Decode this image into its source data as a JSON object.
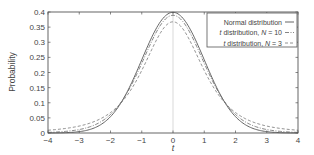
{
  "chart_data": {
    "type": "line",
    "title": "",
    "xlabel": "t",
    "ylabel": "Probability",
    "xlim": [
      -4,
      4
    ],
    "ylim": [
      0,
      0.4
    ],
    "xticks": [
      -4,
      -3,
      -2,
      -1,
      0,
      1,
      2,
      3,
      4
    ],
    "xtick_labels": [
      "−4",
      "−3",
      "−2",
      "−1",
      "0",
      "1",
      "2",
      "3",
      "4"
    ],
    "yticks": [
      0,
      0.05,
      0.1,
      0.15,
      0.2,
      0.25,
      0.3,
      0.35,
      0.4
    ],
    "ytick_labels": [
      "0",
      "0.05",
      "0.1",
      "0.15",
      "0.2",
      "0.25",
      "0.3",
      "0.35",
      "0.4"
    ],
    "grid": false,
    "vertical_reference_line_x": 0,
    "legend_position": "upper right",
    "legend": [
      {
        "label": "Normal distribution",
        "style": "solid"
      },
      {
        "label_prefix": "t distribution, ",
        "label_var": "N",
        "label_suffix": " = 10",
        "style": "dash-dot"
      },
      {
        "label_prefix": "t distribution, ",
        "label_var": "N",
        "label_suffix": " = 3",
        "style": "dashed"
      }
    ],
    "series": [
      {
        "name": "Normal distribution",
        "x": [
          -4,
          -3,
          -2,
          -1,
          0,
          1,
          2,
          3,
          4
        ],
        "values": [
          0.0001,
          0.0044,
          0.054,
          0.242,
          0.399,
          0.242,
          0.054,
          0.0044,
          0.0001
        ]
      },
      {
        "name": "t distribution, N = 10",
        "x": [
          -4,
          -3,
          -2,
          -1,
          0,
          1,
          2,
          3,
          4
        ],
        "values": [
          0.002,
          0.0114,
          0.0611,
          0.2304,
          0.3891,
          0.2304,
          0.0611,
          0.0114,
          0.002
        ]
      },
      {
        "name": "t distribution, N = 3",
        "x": [
          -4,
          -3,
          -2,
          -1,
          0,
          1,
          2,
          3,
          4
        ],
        "values": [
          0.0042,
          0.023,
          0.0675,
          0.2067,
          0.3676,
          0.2067,
          0.0675,
          0.023,
          0.0042
        ]
      }
    ]
  }
}
